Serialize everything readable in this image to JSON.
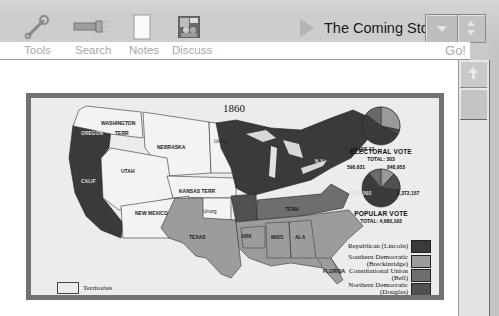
{
  "toolbar": {
    "tools": [
      {
        "label": "Tools",
        "icon": "wrench-icon"
      },
      {
        "label": "Search",
        "icon": "flashlight-icon"
      },
      {
        "label": "Notes",
        "icon": "notepad-icon"
      },
      {
        "label": "Discuss",
        "icon": "discuss-people-icon"
      }
    ],
    "title": "The Coming Storm",
    "go_label": "Go!"
  },
  "map": {
    "year": "1860",
    "territories_label": "Territories",
    "region_labels": [
      {
        "text": "WASHINGTON",
        "sub": ""
      },
      {
        "text": "TERR",
        "sub": ""
      },
      {
        "text": "OREGON",
        "sub": "3"
      },
      {
        "text": "CALIF",
        "sub": "4"
      },
      {
        "text": "UTAH",
        "sub": "TERR"
      },
      {
        "text": "NEBRASKA",
        "sub": "TERR"
      },
      {
        "text": "Unorg",
        "sub": "Terr"
      },
      {
        "text": "KANSAS TERR",
        "sub": ""
      },
      {
        "text": "NEW MEXICO",
        "sub": "TERR"
      },
      {
        "text": "Unorg",
        "sub": "Terr"
      },
      {
        "text": "TEXAS",
        "sub": "4"
      },
      {
        "text": "MINN",
        "sub": "4"
      },
      {
        "text": "WIS",
        "sub": "5"
      },
      {
        "text": "IOWA",
        "sub": "4"
      },
      {
        "text": "MICH",
        "sub": "6"
      },
      {
        "text": "ILL",
        "sub": "11"
      },
      {
        "text": "IND",
        "sub": "13"
      },
      {
        "text": "OHIO",
        "sub": "23"
      },
      {
        "text": "PA",
        "sub": "27"
      },
      {
        "text": "N.Y.",
        "sub": "35"
      },
      {
        "text": "MO",
        "sub": "9"
      },
      {
        "text": "KY",
        "sub": "12"
      },
      {
        "text": "VA",
        "sub": "15"
      },
      {
        "text": "TENN",
        "sub": "12"
      },
      {
        "text": "NC",
        "sub": "10"
      },
      {
        "text": "ARK",
        "sub": "4"
      },
      {
        "text": "SC",
        "sub": "8"
      },
      {
        "text": "MISS",
        "sub": "7"
      },
      {
        "text": "ALA",
        "sub": "9"
      },
      {
        "text": "GA",
        "sub": "10"
      },
      {
        "text": "LA",
        "sub": "6"
      },
      {
        "text": "FLORIDA",
        "sub": "3"
      },
      {
        "text": "VT",
        "sub": "5"
      },
      {
        "text": "NH",
        "sub": "5"
      },
      {
        "text": "ME",
        "sub": "8"
      },
      {
        "text": "MASS 13",
        "sub": ""
      },
      {
        "text": "RI 4",
        "sub": ""
      },
      {
        "text": "CONN 6",
        "sub": ""
      },
      {
        "text": "NJ 7/4",
        "sub": ""
      },
      {
        "text": "DEL",
        "sub": "3"
      },
      {
        "text": "MD",
        "sub": "8"
      }
    ],
    "electoral_vote": {
      "caption": "ELECTORAL VOTE",
      "total": "TOTAL: 303",
      "slices": [
        {
          "label": "59%",
          "value": "180",
          "color": "#3b3b3b"
        },
        {
          "label": "24%",
          "value": "72",
          "color": "#9a9a9a"
        },
        {
          "label": "13%",
          "value": "39",
          "color": "#6a6a6a"
        },
        {
          "label": "4%",
          "value": "12",
          "color": "#4e4e4e"
        }
      ]
    },
    "popular_vote": {
      "caption": "POPULAR VOTE",
      "total": "TOTAL: 4,680,193",
      "numbers": {
        "top_left": "590,631",
        "top_right": "848,953",
        "bottom_left": "1,865,593",
        "bottom_right": "1,372,157"
      }
    },
    "legend": [
      {
        "label": "Republican (Lincoln)",
        "color": "#3a3a3a"
      },
      {
        "label": "Southern Democratic (Breckinridge)",
        "color": "#9c9c9c"
      },
      {
        "label": "Constitutional Union (Bell)",
        "color": "#6e6e6e"
      },
      {
        "label": "Northern Democratic (Douglas)",
        "color": "#505050"
      }
    ]
  }
}
